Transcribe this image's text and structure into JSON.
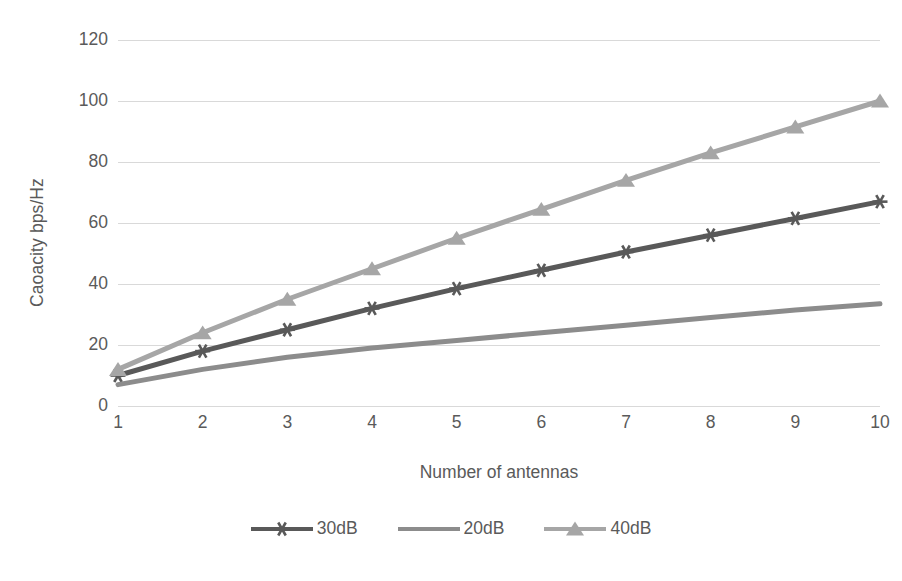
{
  "chart_data": {
    "type": "line",
    "title": "",
    "xlabel": "Number of antennas",
    "ylabel": "Caoacity bps/Hz",
    "x": [
      1,
      2,
      3,
      4,
      5,
      6,
      7,
      8,
      9,
      10
    ],
    "xtick_labels": [
      "1",
      "2",
      "3",
      "4",
      "5",
      "6",
      "7",
      "8",
      "9",
      "10"
    ],
    "ytick_labels": [
      "0",
      "20",
      "40",
      "60",
      "80",
      "100",
      "120"
    ],
    "yticks": [
      0,
      20,
      40,
      60,
      80,
      100,
      120
    ],
    "ylim": [
      0,
      120
    ],
    "xlim": [
      1,
      10
    ],
    "grid": "horizontal",
    "legend_position": "bottom",
    "series": [
      {
        "name": "30dB",
        "color": "#595959",
        "marker": "asterisk",
        "values": [
          10,
          18,
          25,
          32,
          38.5,
          44.5,
          50.5,
          56,
          61.5,
          67
        ]
      },
      {
        "name": "20dB",
        "color": "#8c8c8c",
        "marker": "none",
        "values": [
          7,
          12,
          16,
          19,
          21.5,
          24,
          26.5,
          29,
          31.5,
          33.5
        ]
      },
      {
        "name": "40dB",
        "color": "#a6a6a6",
        "marker": "triangle",
        "values": [
          12,
          24,
          35,
          45,
          55,
          64.5,
          74,
          83,
          91.5,
          100
        ]
      }
    ]
  },
  "axes": {
    "y_title": "Caoacity bps/Hz",
    "x_title": "Number of antennas"
  },
  "legend": {
    "items": [
      {
        "label": "30dB",
        "color": "#595959",
        "marker": "asterisk-marker-icon"
      },
      {
        "label": "20dB",
        "color": "#8c8c8c",
        "marker": "line-marker-icon"
      },
      {
        "label": "40dB",
        "color": "#a6a6a6",
        "marker": "triangle-marker-icon"
      }
    ]
  },
  "colors": {
    "gridline": "#d9d9d9",
    "text": "#5a5a5a",
    "background": "#ffffff"
  }
}
